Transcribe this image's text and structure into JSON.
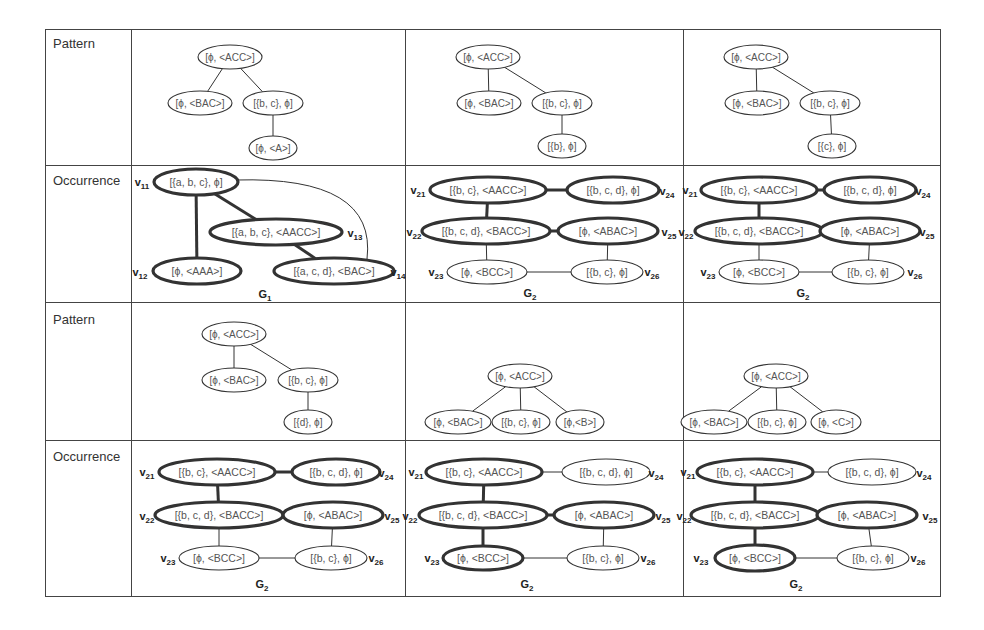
{
  "row_labels": [
    "Pattern",
    "Occurrence",
    "Pattern",
    "Occurrence"
  ],
  "colors": {
    "line": "#333333",
    "text": "#555555",
    "bold": "#222222"
  },
  "cells": [
    {
      "id": "r1c1",
      "type": "pattern",
      "nodes": [
        {
          "id": "p0",
          "label": "[ϕ, <ACC>]",
          "x": 230,
          "y": 57,
          "rx": 32,
          "ry": 12
        },
        {
          "id": "p1",
          "label": "[ϕ, <BAC>]",
          "x": 200,
          "y": 103,
          "rx": 32,
          "ry": 12
        },
        {
          "id": "p2",
          "label": "[{b, c}, ϕ]",
          "x": 273,
          "y": 103,
          "rx": 30,
          "ry": 12
        },
        {
          "id": "p3",
          "label": "[ϕ, <A>]",
          "x": 273,
          "y": 148,
          "rx": 24,
          "ry": 12
        }
      ],
      "edges": [
        [
          "p0",
          "p1"
        ],
        [
          "p0",
          "p2"
        ],
        [
          "p2",
          "p3"
        ]
      ]
    },
    {
      "id": "r1c2",
      "type": "pattern",
      "nodes": [
        {
          "id": "p0",
          "label": "[ϕ, <ACC>]",
          "x": 488,
          "y": 57,
          "rx": 32,
          "ry": 12
        },
        {
          "id": "p1",
          "label": "[ϕ, <BAC>]",
          "x": 489,
          "y": 103,
          "rx": 32,
          "ry": 12
        },
        {
          "id": "p2",
          "label": "[{b, c}, ϕ]",
          "x": 562,
          "y": 103,
          "rx": 30,
          "ry": 12
        },
        {
          "id": "p3",
          "label": "[{b}, ϕ]",
          "x": 562,
          "y": 146,
          "rx": 24,
          "ry": 12
        }
      ],
      "edges": [
        [
          "p0",
          "p1"
        ],
        [
          "p0",
          "p2"
        ],
        [
          "p2",
          "p3"
        ]
      ]
    },
    {
      "id": "r1c3",
      "type": "pattern",
      "nodes": [
        {
          "id": "p0",
          "label": "[ϕ, <ACC>]",
          "x": 756,
          "y": 57,
          "rx": 32,
          "ry": 12
        },
        {
          "id": "p1",
          "label": "[ϕ, <BAC>]",
          "x": 757,
          "y": 103,
          "rx": 32,
          "ry": 12
        },
        {
          "id": "p2",
          "label": "[{b, c}, ϕ]",
          "x": 830,
          "y": 103,
          "rx": 30,
          "ry": 12
        },
        {
          "id": "p3",
          "label": "[{c}, ϕ]",
          "x": 832,
          "y": 146,
          "rx": 24,
          "ry": 12
        }
      ],
      "edges": [
        [
          "p0",
          "p1"
        ],
        [
          "p0",
          "p2"
        ],
        [
          "p2",
          "p3"
        ]
      ]
    },
    {
      "id": "r2c1",
      "type": "occurrence",
      "graph_label": "G1",
      "graph_label_pos": {
        "x": 265,
        "y": 298
      },
      "nodes": [
        {
          "id": "v11",
          "name": "v11",
          "label": "[{a, b, c}, ϕ]",
          "x": 196,
          "y": 182,
          "rx": 42,
          "ry": 13,
          "bold": true,
          "name_pos": {
            "x": 142,
            "y": 186
          }
        },
        {
          "id": "v13",
          "name": "v13",
          "label": "[{a, b, c}, <AACC>]",
          "x": 276,
          "y": 232,
          "rx": 66,
          "ry": 13,
          "bold": true,
          "name_pos": {
            "x": 355,
            "y": 237
          }
        },
        {
          "id": "v12",
          "name": "v12",
          "label": "[ϕ, <AAA>]",
          "x": 197,
          "y": 271,
          "rx": 44,
          "ry": 13,
          "bold": true,
          "name_pos": {
            "x": 140,
            "y": 276
          }
        },
        {
          "id": "v14",
          "name": "v14",
          "label": "[{a, c, d}, <BAC>]",
          "x": 334,
          "y": 271,
          "rx": 60,
          "ry": 13,
          "bold": true,
          "name_pos": {
            "x": 398,
            "y": 276
          }
        }
      ],
      "edges": [
        {
          "a": "v11",
          "b": "v12",
          "bold": true
        },
        {
          "a": "v11",
          "b": "v13",
          "bold": true
        },
        {
          "a": "v13",
          "b": "v14",
          "bold": true
        },
        {
          "a": "v11",
          "b": "v14",
          "bold": false,
          "curve": true
        }
      ]
    },
    {
      "id": "r2c2",
      "type": "occurrence",
      "graph_label": "G2",
      "graph_label_pos": {
        "x": 530,
        "y": 297
      },
      "nodes": [
        {
          "id": "v21",
          "name": "v21",
          "label": "[{b, c}, <AACC>]",
          "x": 488,
          "y": 190,
          "rx": 58,
          "ry": 13,
          "bold": true,
          "name_pos": {
            "x": 418,
            "y": 194
          }
        },
        {
          "id": "v24",
          "name": "v24",
          "label": "[{b, c, d}, ϕ]",
          "x": 613,
          "y": 190,
          "rx": 46,
          "ry": 13,
          "bold": true,
          "name_pos": {
            "x": 667,
            "y": 195
          }
        },
        {
          "id": "v22",
          "name": "v22",
          "label": "[{b, c, d}, <BACC>]",
          "x": 486,
          "y": 231,
          "rx": 64,
          "ry": 13,
          "bold": true,
          "name_pos": {
            "x": 414,
            "y": 236
          }
        },
        {
          "id": "v25",
          "name": "v25",
          "label": "[ϕ, <ABAC>]",
          "x": 608,
          "y": 231,
          "rx": 50,
          "ry": 13,
          "bold": true,
          "name_pos": {
            "x": 669,
            "y": 236
          }
        },
        {
          "id": "v23",
          "name": "v23",
          "label": "[ϕ, <BCC>]",
          "x": 487,
          "y": 272,
          "rx": 40,
          "ry": 12,
          "bold": false,
          "name_pos": {
            "x": 436,
            "y": 276
          }
        },
        {
          "id": "v26",
          "name": "v26",
          "label": "[{b, c}, ϕ]",
          "x": 607,
          "y": 272,
          "rx": 36,
          "ry": 12,
          "bold": false,
          "name_pos": {
            "x": 652,
            "y": 276
          }
        }
      ],
      "edges": [
        {
          "a": "v21",
          "b": "v24",
          "bold": true
        },
        {
          "a": "v21",
          "b": "v22",
          "bold": true
        },
        {
          "a": "v22",
          "b": "v25",
          "bold": true
        },
        {
          "a": "v22",
          "b": "v23",
          "bold": false
        },
        {
          "a": "v25",
          "b": "v26",
          "bold": false
        },
        {
          "a": "v23",
          "b": "v26",
          "bold": false
        }
      ]
    },
    {
      "id": "r2c3",
      "type": "occurrence",
      "graph_label": "G2",
      "graph_label_pos": {
        "x": 803,
        "y": 297
      },
      "nodes": [
        {
          "id": "v21",
          "name": "v21",
          "label": "[{b, c}, <AACC>]",
          "x": 759,
          "y": 190,
          "rx": 58,
          "ry": 13,
          "bold": true,
          "name_pos": {
            "x": 690,
            "y": 194
          }
        },
        {
          "id": "v24",
          "name": "v24",
          "label": "[{b, c, d}, ϕ]",
          "x": 870,
          "y": 190,
          "rx": 46,
          "ry": 13,
          "bold": true,
          "name_pos": {
            "x": 923,
            "y": 195
          }
        },
        {
          "id": "v22",
          "name": "v22",
          "label": "[{b, c, d}, <BACC>]",
          "x": 759,
          "y": 231,
          "rx": 64,
          "ry": 13,
          "bold": true,
          "name_pos": {
            "x": 686,
            "y": 236
          }
        },
        {
          "id": "v25",
          "name": "v25",
          "label": "[ϕ, <ABAC>]",
          "x": 870,
          "y": 231,
          "rx": 50,
          "ry": 13,
          "bold": true,
          "name_pos": {
            "x": 927,
            "y": 236
          }
        },
        {
          "id": "v23",
          "name": "v23",
          "label": "[ϕ, <BCC>]",
          "x": 759,
          "y": 272,
          "rx": 40,
          "ry": 12,
          "bold": false,
          "name_pos": {
            "x": 708,
            "y": 276
          }
        },
        {
          "id": "v26",
          "name": "v26",
          "label": "[{b, c}, ϕ]",
          "x": 868,
          "y": 272,
          "rx": 36,
          "ry": 12,
          "bold": false,
          "name_pos": {
            "x": 915,
            "y": 276
          }
        }
      ],
      "edges": [
        {
          "a": "v21",
          "b": "v24",
          "bold": true
        },
        {
          "a": "v21",
          "b": "v22",
          "bold": true
        },
        {
          "a": "v22",
          "b": "v25",
          "bold": true
        },
        {
          "a": "v22",
          "b": "v23",
          "bold": false
        },
        {
          "a": "v25",
          "b": "v26",
          "bold": false
        },
        {
          "a": "v23",
          "b": "v26",
          "bold": false
        }
      ]
    },
    {
      "id": "r3c1",
      "type": "pattern",
      "nodes": [
        {
          "id": "p0",
          "label": "[ϕ, <ACC>]",
          "x": 234,
          "y": 334,
          "rx": 32,
          "ry": 12
        },
        {
          "id": "p1",
          "label": "[ϕ, <BAC>]",
          "x": 234,
          "y": 380,
          "rx": 32,
          "ry": 12
        },
        {
          "id": "p2",
          "label": "[{b, c}, ϕ]",
          "x": 308,
          "y": 380,
          "rx": 30,
          "ry": 12
        },
        {
          "id": "p3",
          "label": "[{d}, ϕ]",
          "x": 308,
          "y": 422,
          "rx": 24,
          "ry": 12
        }
      ],
      "edges": [
        [
          "p0",
          "p1"
        ],
        [
          "p0",
          "p2"
        ],
        [
          "p2",
          "p3"
        ]
      ]
    },
    {
      "id": "r3c2",
      "type": "pattern",
      "nodes": [
        {
          "id": "p0",
          "label": "[ϕ, <ACC>]",
          "x": 520,
          "y": 376,
          "rx": 32,
          "ry": 12
        },
        {
          "id": "p1",
          "label": "[ϕ, <BAC>]",
          "x": 458,
          "y": 422,
          "rx": 33,
          "ry": 12
        },
        {
          "id": "p2",
          "label": "[{b, c}, ϕ]",
          "x": 521,
          "y": 422,
          "rx": 29,
          "ry": 12
        },
        {
          "id": "p3",
          "label": "[ϕ,<B>]",
          "x": 580,
          "y": 422,
          "rx": 24,
          "ry": 12
        }
      ],
      "edges": [
        [
          "p0",
          "p1"
        ],
        [
          "p0",
          "p2"
        ],
        [
          "p0",
          "p3"
        ]
      ]
    },
    {
      "id": "r3c3",
      "type": "pattern",
      "nodes": [
        {
          "id": "p0",
          "label": "[ϕ, <ACC>]",
          "x": 776,
          "y": 376,
          "rx": 32,
          "ry": 12
        },
        {
          "id": "p1",
          "label": "[ϕ, <BAC>]",
          "x": 714,
          "y": 422,
          "rx": 33,
          "ry": 12
        },
        {
          "id": "p2",
          "label": "[{b, c}, ϕ]",
          "x": 777,
          "y": 422,
          "rx": 29,
          "ry": 12
        },
        {
          "id": "p3",
          "label": "[ϕ, <C>]",
          "x": 836,
          "y": 422,
          "rx": 25,
          "ry": 12
        }
      ],
      "edges": [
        [
          "p0",
          "p1"
        ],
        [
          "p0",
          "p2"
        ],
        [
          "p0",
          "p3"
        ]
      ]
    },
    {
      "id": "r4c1",
      "type": "occurrence",
      "graph_label": "G2",
      "graph_label_pos": {
        "x": 262,
        "y": 588
      },
      "nodes": [
        {
          "id": "v21",
          "name": "v21",
          "label": "[{b, c}, <AACC>]",
          "x": 217,
          "y": 472,
          "rx": 58,
          "ry": 13,
          "bold": true,
          "name_pos": {
            "x": 147,
            "y": 476
          }
        },
        {
          "id": "v24",
          "name": "v24",
          "label": "[{b, c, d}, ϕ]",
          "x": 336,
          "y": 472,
          "rx": 44,
          "ry": 13,
          "bold": true,
          "name_pos": {
            "x": 386,
            "y": 477
          }
        },
        {
          "id": "v22",
          "name": "v22",
          "label": "[{b, c, d}, <BACC>]",
          "x": 219,
          "y": 515,
          "rx": 64,
          "ry": 13,
          "bold": true,
          "name_pos": {
            "x": 147,
            "y": 520
          }
        },
        {
          "id": "v25",
          "name": "v25",
          "label": "[ϕ, <ABAC>]",
          "x": 333,
          "y": 515,
          "rx": 50,
          "ry": 13,
          "bold": true,
          "name_pos": {
            "x": 392,
            "y": 520
          }
        },
        {
          "id": "v23",
          "name": "v23",
          "label": "[ϕ, <BCC>]",
          "x": 219,
          "y": 558,
          "rx": 40,
          "ry": 12,
          "bold": false,
          "name_pos": {
            "x": 168,
            "y": 562
          }
        },
        {
          "id": "v26",
          "name": "v26",
          "label": "[{b, c}, ϕ]",
          "x": 331,
          "y": 558,
          "rx": 36,
          "ry": 12,
          "bold": false,
          "name_pos": {
            "x": 376,
            "y": 562
          }
        }
      ],
      "edges": [
        {
          "a": "v21",
          "b": "v24",
          "bold": true
        },
        {
          "a": "v21",
          "b": "v22",
          "bold": true
        },
        {
          "a": "v22",
          "b": "v25",
          "bold": true
        },
        {
          "a": "v22",
          "b": "v23",
          "bold": false
        },
        {
          "a": "v25",
          "b": "v26",
          "bold": false
        },
        {
          "a": "v23",
          "b": "v26",
          "bold": false
        }
      ]
    },
    {
      "id": "r4c2",
      "type": "occurrence",
      "graph_label": "G2",
      "graph_label_pos": {
        "x": 527,
        "y": 588
      },
      "nodes": [
        {
          "id": "v21",
          "name": "v21",
          "label": "[{b, c}, <AACC>]",
          "x": 484,
          "y": 472,
          "rx": 58,
          "ry": 13,
          "bold": true,
          "name_pos": {
            "x": 416,
            "y": 476
          }
        },
        {
          "id": "v24",
          "name": "v24",
          "label": "[{b, c, d}, ϕ]",
          "x": 606,
          "y": 472,
          "rx": 44,
          "ry": 13,
          "bold": false,
          "name_pos": {
            "x": 656,
            "y": 477
          }
        },
        {
          "id": "v22",
          "name": "v22",
          "label": "[{b, c, d}, <BACC>]",
          "x": 483,
          "y": 515,
          "rx": 64,
          "ry": 13,
          "bold": true,
          "name_pos": {
            "x": 410,
            "y": 520
          }
        },
        {
          "id": "v25",
          "name": "v25",
          "label": "[ϕ, <ABAC>]",
          "x": 604,
          "y": 515,
          "rx": 50,
          "ry": 13,
          "bold": true,
          "name_pos": {
            "x": 663,
            "y": 520
          }
        },
        {
          "id": "v23",
          "name": "v23",
          "label": "[ϕ, <BCC>]",
          "x": 483,
          "y": 558,
          "rx": 40,
          "ry": 12,
          "bold": true,
          "name_pos": {
            "x": 432,
            "y": 562
          }
        },
        {
          "id": "v26",
          "name": "v26",
          "label": "[{b, c}, ϕ]",
          "x": 603,
          "y": 558,
          "rx": 36,
          "ry": 12,
          "bold": false,
          "name_pos": {
            "x": 648,
            "y": 562
          }
        }
      ],
      "edges": [
        {
          "a": "v21",
          "b": "v24",
          "bold": false
        },
        {
          "a": "v21",
          "b": "v22",
          "bold": true
        },
        {
          "a": "v22",
          "b": "v25",
          "bold": true
        },
        {
          "a": "v22",
          "b": "v23",
          "bold": true
        },
        {
          "a": "v25",
          "b": "v26",
          "bold": false
        },
        {
          "a": "v23",
          "b": "v26",
          "bold": false
        }
      ]
    },
    {
      "id": "r4c3",
      "type": "occurrence",
      "graph_label": "G2",
      "graph_label_pos": {
        "x": 796,
        "y": 588
      },
      "nodes": [
        {
          "id": "v21",
          "name": "v21",
          "label": "[{b, c}, <AACC>]",
          "x": 755,
          "y": 472,
          "rx": 58,
          "ry": 13,
          "bold": true,
          "name_pos": {
            "x": 688,
            "y": 476
          }
        },
        {
          "id": "v24",
          "name": "v24",
          "label": "[{b, c, d}, ϕ]",
          "x": 872,
          "y": 472,
          "rx": 44,
          "ry": 13,
          "bold": false,
          "name_pos": {
            "x": 924,
            "y": 477
          }
        },
        {
          "id": "v22",
          "name": "v22",
          "label": "[{b, c, d}, <BACC>]",
          "x": 755,
          "y": 515,
          "rx": 64,
          "ry": 13,
          "bold": true,
          "name_pos": {
            "x": 684,
            "y": 520
          }
        },
        {
          "id": "v25",
          "name": "v25",
          "label": "[ϕ, <ABAC>]",
          "x": 867,
          "y": 515,
          "rx": 50,
          "ry": 13,
          "bold": true,
          "name_pos": {
            "x": 930,
            "y": 520
          }
        },
        {
          "id": "v23",
          "name": "v23",
          "label": "[ϕ, <BCC>]",
          "x": 755,
          "y": 558,
          "rx": 40,
          "ry": 13,
          "bold": true,
          "name_pos": {
            "x": 701,
            "y": 562
          }
        },
        {
          "id": "v26",
          "name": "v26",
          "label": "[{b, c}, ϕ]",
          "x": 873,
          "y": 558,
          "rx": 36,
          "ry": 12,
          "bold": false,
          "name_pos": {
            "x": 918,
            "y": 562
          }
        }
      ],
      "edges": [
        {
          "a": "v21",
          "b": "v24",
          "bold": false
        },
        {
          "a": "v21",
          "b": "v22",
          "bold": true
        },
        {
          "a": "v22",
          "b": "v25",
          "bold": true
        },
        {
          "a": "v22",
          "b": "v23",
          "bold": true
        },
        {
          "a": "v25",
          "b": "v26",
          "bold": false
        },
        {
          "a": "v23",
          "b": "v26",
          "bold": false
        }
      ]
    }
  ]
}
